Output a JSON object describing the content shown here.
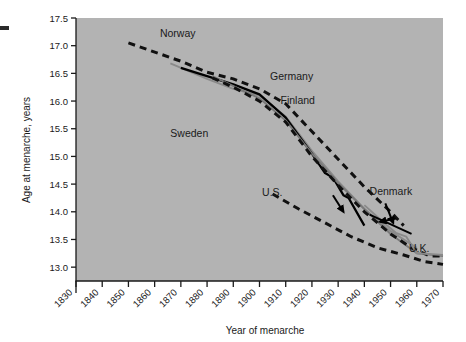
{
  "chart_data": {
    "type": "line",
    "title": "",
    "xlabel": "Year of menarche",
    "ylabel": "Age at menarche, years",
    "xlim": [
      1830,
      1970
    ],
    "ylim": [
      12.75,
      17.5
    ],
    "xticks": [
      "1830",
      "1840",
      "1850",
      "1860",
      "1870",
      "1880",
      "1890",
      "1900",
      "1910",
      "1920",
      "1930",
      "1940",
      "1950",
      "1960",
      "1970"
    ],
    "yticks": [
      "13.0",
      "13.5",
      "14.0",
      "14.5",
      "15.0",
      "15.5",
      "16.0",
      "16.5",
      "17.0",
      "17.5"
    ],
    "grid": false,
    "legend_position": "inline-annotations",
    "plot_background": "#b3b3b3",
    "series": [
      {
        "name": "Norway",
        "style": "dashed",
        "color": "#111111",
        "label_x": 1862,
        "label_y": 17.15,
        "points": [
          [
            1850,
            17.05
          ],
          [
            1870,
            16.72
          ],
          [
            1880,
            16.52
          ],
          [
            1890,
            16.4
          ],
          [
            1900,
            16.22
          ],
          [
            1910,
            15.95
          ],
          [
            1920,
            15.45
          ],
          [
            1930,
            14.95
          ],
          [
            1940,
            14.45
          ],
          [
            1950,
            14.0
          ],
          [
            1955,
            13.75
          ]
        ]
      },
      {
        "name": "Sweden",
        "style": "solid",
        "color": "#8a8a8a",
        "label_x": 1866,
        "label_y": 15.35,
        "points": [
          [
            1866,
            16.68
          ],
          [
            1880,
            16.4
          ],
          [
            1890,
            16.22
          ],
          [
            1900,
            16.1
          ],
          [
            1910,
            15.72
          ],
          [
            1920,
            15.1
          ],
          [
            1930,
            14.55
          ],
          [
            1940,
            14.05
          ],
          [
            1950,
            13.65
          ],
          [
            1960,
            13.35
          ]
        ]
      },
      {
        "name": "Germany",
        "style": "solid",
        "color": "#000000",
        "label_x": 1904,
        "label_y": 16.38,
        "points": [
          [
            1870,
            16.6
          ],
          [
            1890,
            16.3
          ],
          [
            1900,
            16.12
          ],
          [
            1910,
            15.7
          ],
          [
            1920,
            15.05
          ],
          [
            1925,
            14.7
          ],
          [
            1928,
            14.62
          ],
          [
            1932,
            14.3
          ],
          [
            1934,
            14.25
          ],
          [
            1940,
            13.75
          ]
        ]
      },
      {
        "name": "Finland",
        "style": "solid",
        "color": "#7a7a7a",
        "label_x": 1908,
        "label_y": 15.95,
        "points": [
          [
            1882,
            16.45
          ],
          [
            1900,
            16.05
          ],
          [
            1910,
            15.65
          ],
          [
            1920,
            15.05
          ],
          [
            1930,
            14.52
          ],
          [
            1940,
            14.05
          ],
          [
            1950,
            13.6
          ],
          [
            1960,
            13.25
          ],
          [
            1970,
            13.2
          ]
        ]
      },
      {
        "name": "Denmark",
        "style": "dashed",
        "color": "#111111",
        "label_x": 1942,
        "label_y": 14.3,
        "points": [
          [
            1882,
            16.42
          ],
          [
            1890,
            16.25
          ],
          [
            1900,
            16.0
          ],
          [
            1910,
            15.62
          ],
          [
            1920,
            15.0
          ],
          [
            1930,
            14.48
          ],
          [
            1940,
            14.0
          ],
          [
            1950,
            13.6
          ],
          [
            1958,
            13.35
          ],
          [
            1965,
            13.2
          ],
          [
            1970,
            13.2
          ]
        ]
      },
      {
        "name": "U.S.",
        "style": "dashed",
        "color": "#111111",
        "label_x": 1901,
        "label_y": 14.28,
        "points": [
          [
            1905,
            14.32
          ],
          [
            1915,
            14.05
          ],
          [
            1925,
            13.8
          ],
          [
            1935,
            13.55
          ],
          [
            1945,
            13.35
          ],
          [
            1955,
            13.22
          ],
          [
            1963,
            13.1
          ],
          [
            1970,
            13.05
          ]
        ]
      },
      {
        "name": "U.K.",
        "style": "solid",
        "color": "#8a8a8a",
        "label_x": 1957,
        "label_y": 13.28,
        "points": [
          [
            1940,
            14.12
          ],
          [
            1948,
            13.78
          ],
          [
            1952,
            13.62
          ],
          [
            1956,
            13.55
          ],
          [
            1960,
            13.25
          ],
          [
            1970,
            13.22
          ]
        ]
      }
    ],
    "annotations": [
      {
        "name": "denmark-arrow",
        "text": "",
        "from": [
          1948,
          14.15
        ],
        "to": [
          1951,
          13.8
        ]
      },
      {
        "name": "denmark-pointer-line",
        "text": "",
        "from": [
          1942,
          13.95
        ],
        "to": [
          1958,
          13.6
        ]
      },
      {
        "name": "germany-arrow",
        "text": "",
        "from": [
          1928,
          14.3
        ],
        "to": [
          1932,
          14.0
        ]
      },
      {
        "name": "uk-arrow",
        "text": "",
        "from": [
          1952,
          13.88
        ],
        "to": [
          1946,
          13.82
        ]
      }
    ]
  }
}
